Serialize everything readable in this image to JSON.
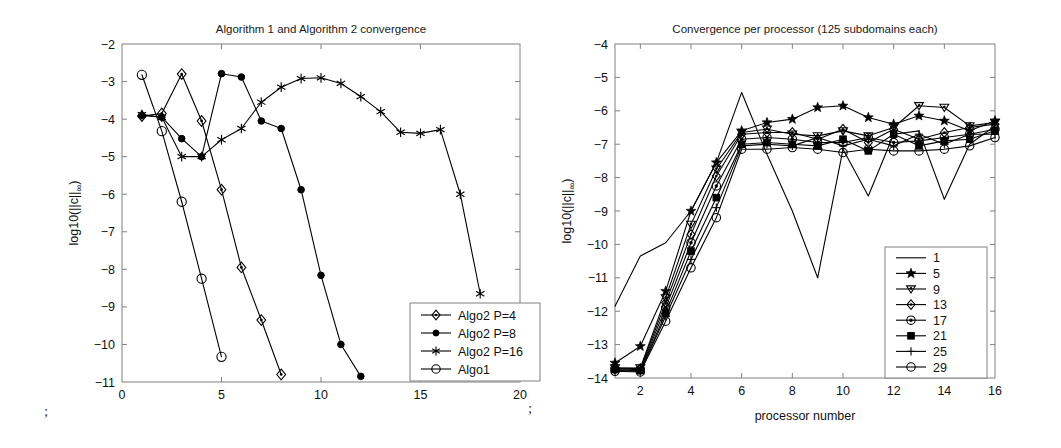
{
  "figure": {
    "background": "#ffffff",
    "axis_color": "#808080",
    "line_color": "#000000",
    "artifacts": [
      {
        "name": "stray-mark-left",
        "text": ";",
        "x": 44,
        "y": 404
      },
      {
        "name": "stray-mark-right",
        "text": ";",
        "x": 528,
        "y": 401
      }
    ]
  },
  "chart_data": [
    {
      "id": "left",
      "type": "line",
      "title": "Algorithm 1 and Algorithm 2 convergence",
      "xlabel": "",
      "ylabel": "log10(||c||∞)",
      "ylabel_parts": {
        "prefix": "log10(||c||",
        "sub": "∞",
        "suffix": ")"
      },
      "xlim": [
        0,
        20
      ],
      "ylim": [
        -11,
        -2
      ],
      "xticks": [
        0,
        5,
        10,
        15,
        20
      ],
      "yticks": [
        -2,
        -3,
        -4,
        -5,
        -6,
        -7,
        -8,
        -9,
        -10,
        -11
      ],
      "xticklabels": [
        "0",
        "5",
        "10",
        "15",
        "20"
      ],
      "yticklabels": [
        "-2",
        "-3",
        "-4",
        "-5",
        "-6",
        "-7",
        "-8",
        "-9",
        "-10",
        "-11"
      ],
      "grid": false,
      "legend_position": "lower-right",
      "series": [
        {
          "name": "Algo2 P=4",
          "marker": "diamond",
          "x": [
            1,
            2,
            3,
            4,
            5,
            6,
            7,
            8
          ],
          "y": [
            -3.92,
            -3.85,
            -2.8,
            -4.05,
            -5.88,
            -7.95,
            -9.35,
            -10.8
          ]
        },
        {
          "name": "Algo2 P=8",
          "marker": "filled-circle",
          "x": [
            1,
            2,
            3,
            4,
            5,
            6,
            7,
            8,
            9,
            10,
            11,
            12
          ],
          "y": [
            -3.9,
            -3.95,
            -4.52,
            -5.0,
            -2.79,
            -2.88,
            -4.05,
            -4.25,
            -5.88,
            -8.16,
            -10.0,
            -10.85
          ]
        },
        {
          "name": "Algo2 P=16",
          "marker": "star",
          "x": [
            1,
            2,
            3,
            4,
            5,
            6,
            7,
            8,
            9,
            10,
            11,
            12,
            13,
            14,
            15,
            16,
            17,
            18
          ],
          "y": [
            -3.88,
            -3.95,
            -5.0,
            -5.0,
            -4.55,
            -4.25,
            -3.55,
            -3.15,
            -2.92,
            -2.9,
            -3.05,
            -3.4,
            -3.8,
            -4.35,
            -4.38,
            -4.28,
            -6.0,
            -8.65
          ]
        },
        {
          "name": "Algo1",
          "marker": "open-circle",
          "x": [
            1,
            2,
            3,
            4,
            5
          ],
          "y": [
            -2.82,
            -4.32,
            -6.2,
            -8.25,
            -10.33
          ]
        }
      ]
    },
    {
      "id": "right",
      "type": "line",
      "title": "Convergence per processor (125 subdomains each)",
      "xlabel": "processor number",
      "ylabel": "log10(||c||∞)",
      "ylabel_parts": {
        "prefix": "log10(||c||",
        "sub": "∞",
        "suffix": ")"
      },
      "xlim": [
        1,
        16
      ],
      "ylim": [
        -14,
        -4
      ],
      "xticks": [
        2,
        4,
        6,
        8,
        10,
        12,
        14,
        16
      ],
      "yticks": [
        -4,
        -5,
        -6,
        -7,
        -8,
        -9,
        -10,
        -11,
        -12,
        -13,
        -14
      ],
      "xticklabels": [
        "2",
        "4",
        "6",
        "8",
        "10",
        "12",
        "14",
        "16"
      ],
      "yticklabels": [
        "-4",
        "-5",
        "-6",
        "-7",
        "-8",
        "-9",
        "-10",
        "-11",
        "-12",
        "-13",
        "-14"
      ],
      "grid": false,
      "legend_position": "lower-right",
      "x": [
        1,
        2,
        3,
        4,
        5,
        6,
        7,
        8,
        9,
        10,
        11,
        12,
        13,
        14,
        15,
        16
      ],
      "series": [
        {
          "name": "1",
          "marker": "none",
          "values": [
            -11.85,
            -10.35,
            -9.95,
            -9.0,
            -7.55,
            -5.45,
            -7.3,
            -9.0,
            -11.0,
            -7.15,
            -8.55,
            -6.7,
            -6.6,
            -8.65,
            -7.0,
            -6.45
          ]
        },
        {
          "name": "5",
          "marker": "pentagram",
          "values": [
            -13.55,
            -13.05,
            -11.4,
            -9.0,
            -7.55,
            -6.6,
            -6.35,
            -6.25,
            -5.9,
            -5.85,
            -6.2,
            -6.4,
            -6.15,
            -6.3,
            -6.6,
            -6.3
          ]
        },
        {
          "name": "9",
          "marker": "triangle-down",
          "values": [
            -13.7,
            -13.7,
            -11.6,
            -9.4,
            -7.75,
            -6.65,
            -6.55,
            -6.7,
            -6.75,
            -6.6,
            -6.75,
            -6.5,
            -5.85,
            -5.9,
            -6.45,
            -6.35
          ]
        },
        {
          "name": "13",
          "marker": "diamond",
          "values": [
            -13.7,
            -13.72,
            -11.75,
            -9.7,
            -7.95,
            -6.7,
            -6.65,
            -6.65,
            -6.85,
            -6.55,
            -6.95,
            -6.55,
            -6.85,
            -6.65,
            -6.5,
            -6.4
          ]
        },
        {
          "name": "17",
          "marker": "circle-dot",
          "values": [
            -13.72,
            -13.75,
            -11.9,
            -9.95,
            -8.25,
            -6.85,
            -6.8,
            -6.85,
            -6.95,
            -6.95,
            -6.8,
            -6.95,
            -6.9,
            -6.8,
            -6.7,
            -6.55
          ]
        },
        {
          "name": "21",
          "marker": "filled-square",
          "values": [
            -13.75,
            -13.78,
            -12.05,
            -10.2,
            -8.6,
            -7.0,
            -6.95,
            -7.0,
            -7.05,
            -6.85,
            -7.2,
            -6.7,
            -7.05,
            -6.9,
            -6.85,
            -6.6
          ]
        },
        {
          "name": "25",
          "marker": "plus",
          "values": [
            -13.78,
            -13.8,
            -12.15,
            -10.45,
            -8.9,
            -7.05,
            -7.0,
            -7.05,
            -6.8,
            -7.05,
            -6.85,
            -7.05,
            -6.7,
            -7.0,
            -6.7,
            -6.7
          ]
        },
        {
          "name": "29",
          "marker": "open-circle",
          "values": [
            -13.8,
            -13.82,
            -12.3,
            -10.7,
            -9.2,
            -7.15,
            -7.15,
            -7.1,
            -7.15,
            -7.25,
            -7.15,
            -7.2,
            -7.2,
            -7.15,
            -7.05,
            -6.8
          ]
        }
      ]
    }
  ]
}
